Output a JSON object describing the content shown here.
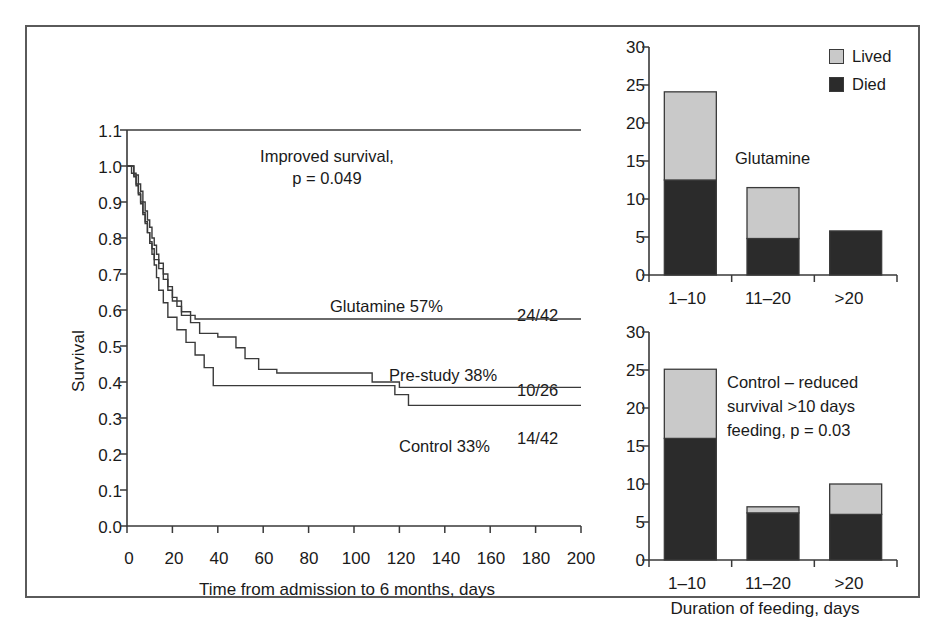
{
  "figure": {
    "border_color": "#5a5a5a",
    "background": "#ffffff"
  },
  "colors": {
    "lived": "#c9c9c9",
    "died": "#2b2b2b",
    "ink": "#3a3a3a"
  },
  "km": {
    "ylabel": "Survival",
    "xlabel": "Time from admission to 6 months, days",
    "yticks": [
      "0.0",
      "0.1",
      "0.2",
      "0.3",
      "0.4",
      "0.5",
      "0.6",
      "0.7",
      "0.8",
      "0.9",
      "1.0",
      "1.1"
    ],
    "xticks": [
      "0",
      "20",
      "40",
      "60",
      "80",
      "100",
      "120",
      "140",
      "160",
      "180",
      "200"
    ],
    "annotation_line1": "Improved survival,",
    "annotation_line2": "p = 0.049",
    "series_labels": {
      "glutamine": "Glutamine 57%",
      "glutamine_ratio": "24/42",
      "prestudy": "Pre-study 38%",
      "prestudy_ratio": "10/26",
      "control": "Control 33%",
      "control_ratio": "14/42"
    }
  },
  "bar_top": {
    "title": "Glutamine",
    "legend": [
      {
        "label": "Lived",
        "color": "#c9c9c9"
      },
      {
        "label": "Died",
        "color": "#2b2b2b"
      }
    ],
    "yticks": [
      "0",
      "5",
      "10",
      "15",
      "20",
      "25",
      "30"
    ],
    "xticks": [
      "1–10",
      "11–20",
      ">20"
    ]
  },
  "bar_bottom": {
    "annotation_line1": "Control – reduced",
    "annotation_line2": "survival >10 days",
    "annotation_line3": "feeding, p = 0.03",
    "yticks": [
      "0",
      "5",
      "10",
      "15",
      "20",
      "25",
      "30"
    ],
    "xticks": [
      "1–10",
      "11–20",
      ">20"
    ],
    "xlabel": "Duration of feeding, days"
  },
  "chart_data": [
    {
      "id": "kaplan-meier",
      "type": "line",
      "title": "",
      "xlabel": "Time from admission to 6 months, days",
      "ylabel": "Survival",
      "xlim": [
        0,
        200
      ],
      "ylim": [
        0.0,
        1.1
      ],
      "xticks": [
        0,
        20,
        40,
        60,
        80,
        100,
        120,
        140,
        160,
        180,
        200
      ],
      "yticks": [
        0.0,
        0.1,
        0.2,
        0.3,
        0.4,
        0.5,
        0.6,
        0.7,
        0.8,
        0.9,
        1.0,
        1.1
      ],
      "grid": false,
      "legend_position": "inline-annotations",
      "annotations": [
        {
          "text": "Improved survival,",
          "x": 95,
          "y": 1.02
        },
        {
          "text": "p = 0.049",
          "x": 95,
          "y": 0.96
        },
        {
          "text": "Glutamine 57%",
          "x": 105,
          "y": 0.635
        },
        {
          "text": "24/42",
          "x": 183,
          "y": 0.6
        },
        {
          "text": "Pre-study 38%",
          "x": 130,
          "y": 0.455
        },
        {
          "text": "10/26",
          "x": 183,
          "y": 0.425
        },
        {
          "text": "Control 33%",
          "x": 140,
          "y": 0.315
        },
        {
          "text": "14/42",
          "x": 183,
          "y": 0.325
        }
      ],
      "series": [
        {
          "name": "Glutamine 57%",
          "n_events": "24/42",
          "final_survival": 0.57,
          "steps": [
            [
              0,
              1.0
            ],
            [
              3,
              1.0
            ],
            [
              3,
              0.975
            ],
            [
              5,
              0.975
            ],
            [
              5,
              0.95
            ],
            [
              6,
              0.95
            ],
            [
              6,
              0.93
            ],
            [
              7,
              0.93
            ],
            [
              7,
              0.9
            ],
            [
              8,
              0.9
            ],
            [
              8,
              0.875
            ],
            [
              9,
              0.875
            ],
            [
              9,
              0.85
            ],
            [
              10,
              0.85
            ],
            [
              10,
              0.83
            ],
            [
              11,
              0.83
            ],
            [
              11,
              0.8
            ],
            [
              12,
              0.8
            ],
            [
              12,
              0.78
            ],
            [
              13,
              0.78
            ],
            [
              13,
              0.755
            ],
            [
              14,
              0.755
            ],
            [
              14,
              0.73
            ],
            [
              16,
              0.73
            ],
            [
              16,
              0.7
            ],
            [
              18,
              0.7
            ],
            [
              18,
              0.665
            ],
            [
              20,
              0.665
            ],
            [
              20,
              0.635
            ],
            [
              22,
              0.635
            ],
            [
              22,
              0.61
            ],
            [
              24,
              0.61
            ],
            [
              24,
              0.585
            ],
            [
              30,
              0.585
            ],
            [
              30,
              0.575
            ],
            [
              200,
              0.575
            ]
          ]
        },
        {
          "name": "Pre-study 38%",
          "n_events": "10/26",
          "final_survival": 0.38,
          "steps": [
            [
              0,
              1.0
            ],
            [
              3,
              1.0
            ],
            [
              3,
              0.97
            ],
            [
              4,
              0.97
            ],
            [
              4,
              0.945
            ],
            [
              5,
              0.945
            ],
            [
              5,
              0.92
            ],
            [
              6,
              0.92
            ],
            [
              6,
              0.895
            ],
            [
              7,
              0.895
            ],
            [
              7,
              0.865
            ],
            [
              8,
              0.865
            ],
            [
              8,
              0.84
            ],
            [
              9,
              0.84
            ],
            [
              9,
              0.815
            ],
            [
              10,
              0.815
            ],
            [
              10,
              0.79
            ],
            [
              11,
              0.79
            ],
            [
              11,
              0.77
            ],
            [
              12,
              0.77
            ],
            [
              12,
              0.74
            ],
            [
              14,
              0.74
            ],
            [
              14,
              0.715
            ],
            [
              16,
              0.715
            ],
            [
              16,
              0.685
            ],
            [
              18,
              0.685
            ],
            [
              18,
              0.655
            ],
            [
              20,
              0.655
            ],
            [
              20,
              0.625
            ],
            [
              24,
              0.625
            ],
            [
              24,
              0.595
            ],
            [
              28,
              0.595
            ],
            [
              28,
              0.565
            ],
            [
              32,
              0.565
            ],
            [
              32,
              0.535
            ],
            [
              40,
              0.535
            ],
            [
              40,
              0.525
            ],
            [
              48,
              0.525
            ],
            [
              48,
              0.495
            ],
            [
              52,
              0.495
            ],
            [
              52,
              0.465
            ],
            [
              58,
              0.465
            ],
            [
              58,
              0.435
            ],
            [
              66,
              0.435
            ],
            [
              66,
              0.425
            ],
            [
              108,
              0.425
            ],
            [
              108,
              0.4
            ],
            [
              120,
              0.4
            ],
            [
              120,
              0.385
            ],
            [
              200,
              0.385
            ]
          ]
        },
        {
          "name": "Control 33%",
          "n_events": "14/42",
          "final_survival": 0.33,
          "steps": [
            [
              0,
              1.0
            ],
            [
              2,
              1.0
            ],
            [
              2,
              0.98
            ],
            [
              4,
              0.98
            ],
            [
              4,
              0.95
            ],
            [
              5,
              0.95
            ],
            [
              5,
              0.925
            ],
            [
              6,
              0.925
            ],
            [
              6,
              0.9
            ],
            [
              7,
              0.9
            ],
            [
              7,
              0.87
            ],
            [
              8,
              0.87
            ],
            [
              8,
              0.845
            ],
            [
              9,
              0.845
            ],
            [
              9,
              0.815
            ],
            [
              10,
              0.815
            ],
            [
              10,
              0.785
            ],
            [
              11,
              0.785
            ],
            [
              11,
              0.755
            ],
            [
              12,
              0.755
            ],
            [
              12,
              0.725
            ],
            [
              13,
              0.725
            ],
            [
              13,
              0.69
            ],
            [
              14,
              0.69
            ],
            [
              14,
              0.655
            ],
            [
              16,
              0.655
            ],
            [
              16,
              0.62
            ],
            [
              18,
              0.62
            ],
            [
              18,
              0.58
            ],
            [
              22,
              0.58
            ],
            [
              22,
              0.545
            ],
            [
              26,
              0.545
            ],
            [
              26,
              0.51
            ],
            [
              30,
              0.51
            ],
            [
              30,
              0.475
            ],
            [
              34,
              0.475
            ],
            [
              34,
              0.44
            ],
            [
              38,
              0.44
            ],
            [
              38,
              0.39
            ],
            [
              118,
              0.39
            ],
            [
              118,
              0.365
            ],
            [
              124,
              0.365
            ],
            [
              124,
              0.335
            ],
            [
              200,
              0.335
            ]
          ]
        }
      ]
    },
    {
      "id": "glutamine-feeding-duration",
      "type": "bar",
      "title": "Glutamine",
      "stacked": true,
      "xlabel": "",
      "ylabel": "",
      "ylim": [
        0,
        30
      ],
      "yticks": [
        0,
        5,
        10,
        15,
        20,
        25,
        30
      ],
      "categories": [
        "1–10",
        "11–20",
        ">20"
      ],
      "grid": false,
      "legend_position": "top-right",
      "series": [
        {
          "name": "Died",
          "color": "#2b2b2b",
          "values": [
            12.5,
            4.8,
            5.8
          ]
        },
        {
          "name": "Lived",
          "color": "#c9c9c9",
          "values": [
            11.6,
            6.7,
            0.0
          ]
        }
      ],
      "totals": [
        24.1,
        11.5,
        5.8
      ]
    },
    {
      "id": "control-feeding-duration",
      "type": "bar",
      "title": "Control – reduced survival >10 days feeding, p = 0.03",
      "stacked": true,
      "xlabel": "Duration of feeding, days",
      "ylabel": "",
      "ylim": [
        0,
        30
      ],
      "yticks": [
        0,
        5,
        10,
        15,
        20,
        25,
        30
      ],
      "categories": [
        "1–10",
        "11–20",
        ">20"
      ],
      "grid": false,
      "legend_position": "shared-with-top-panel",
      "series": [
        {
          "name": "Died",
          "color": "#2b2b2b",
          "values": [
            16.0,
            6.2,
            6.0
          ]
        },
        {
          "name": "Lived",
          "color": "#c9c9c9",
          "values": [
            9.1,
            0.8,
            4.0
          ]
        }
      ],
      "totals": [
        25.1,
        7.0,
        10.0
      ]
    }
  ]
}
